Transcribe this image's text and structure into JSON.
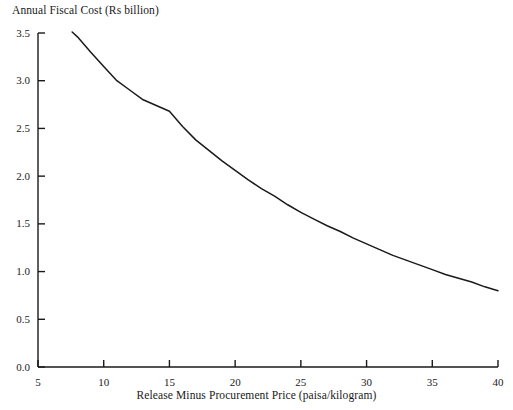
{
  "chart_data": {
    "type": "line",
    "title": "",
    "subtitle": "",
    "xlabel": "Release Minus Procurement Price (paisa/kilogram)",
    "ylabel": "Annual Fiscal Cost (Rs billion)",
    "xlim": [
      5,
      40
    ],
    "ylim": [
      0.0,
      3.5
    ],
    "grid": false,
    "legend": null,
    "xticks": [
      "5",
      "10",
      "15",
      "20",
      "25",
      "30",
      "35",
      "40"
    ],
    "xtick_values": [
      5,
      10,
      15,
      20,
      25,
      30,
      35,
      40
    ],
    "yticks": [
      "0.0",
      "0.5",
      "1.0",
      "1.5",
      "2.0",
      "2.5",
      "3.0",
      "3.5"
    ],
    "ytick_values": [
      0.0,
      0.5,
      1.0,
      1.5,
      2.0,
      2.5,
      3.0,
      3.5
    ],
    "line_color": "#1a1a1a",
    "series": [
      {
        "name": "Annual Fiscal Cost",
        "x": [
          7.6,
          8,
          9,
          10,
          11,
          12,
          13,
          14,
          15,
          16,
          17,
          18,
          19,
          20,
          21,
          22,
          23,
          24,
          25,
          26,
          27,
          28,
          29,
          30,
          31,
          32,
          33,
          34,
          35,
          36,
          37,
          38,
          39,
          40
        ],
        "values": [
          3.51,
          3.46,
          3.3,
          3.15,
          3.0,
          2.9,
          2.8,
          2.74,
          2.68,
          2.52,
          2.38,
          2.27,
          2.16,
          2.06,
          1.96,
          1.87,
          1.79,
          1.7,
          1.62,
          1.55,
          1.48,
          1.42,
          1.35,
          1.29,
          1.23,
          1.17,
          1.12,
          1.07,
          1.02,
          0.97,
          0.93,
          0.89,
          0.84,
          0.8
        ]
      }
    ]
  },
  "axes": {
    "y_title": "Annual Fiscal Cost (Rs billion)",
    "x_title": "Release Minus Procurement Price (paisa/kilogram)"
  }
}
